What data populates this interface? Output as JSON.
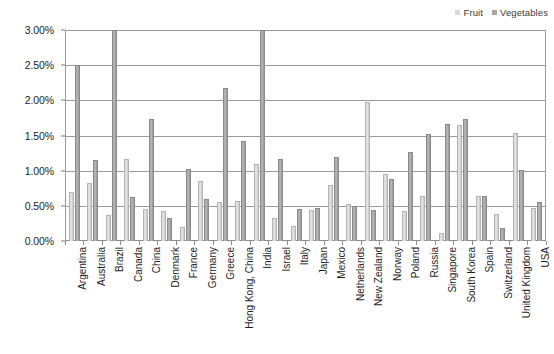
{
  "legend": {
    "position": "top-right",
    "entries": [
      {
        "label": "Fruit",
        "color": "#d9d9d9"
      },
      {
        "label": "Vegetables",
        "color": "#a6a6a6"
      }
    ]
  },
  "axis": {
    "y_ticks": [
      "0.00%",
      "0.50%",
      "1.00%",
      "1.50%",
      "2.00%",
      "2.50%",
      "3.00%"
    ]
  },
  "chart_data": {
    "type": "bar",
    "title": "",
    "subtitle": "",
    "xlabel": "",
    "ylabel": "",
    "grid": true,
    "legend_position": "top-right",
    "ylim": [
      0,
      3.0
    ],
    "y_tick_step": 0.5,
    "y_unit": "%",
    "y_tick_labels": [
      "0.00%",
      "0.50%",
      "1.00%",
      "1.50%",
      "2.00%",
      "2.50%",
      "3.00%"
    ],
    "categories": [
      "Argentina",
      "Australia",
      "Brazil",
      "Canada",
      "China",
      "Denmark",
      "France",
      "Germany",
      "Greece",
      "Hong Kong, China",
      "India",
      "Israel",
      "Italy",
      "Japan",
      "Mexico",
      "Netherlands",
      "New Zealand",
      "Norway",
      "Poland",
      "Russia",
      "Singapore",
      "South Korea",
      "Spain",
      "Switzerland",
      "United Kingdom",
      "USA"
    ],
    "series": [
      {
        "name": "Fruit",
        "color": "#d9d9d9",
        "values": [
          0.7,
          0.83,
          0.37,
          1.16,
          0.46,
          0.42,
          0.2,
          0.85,
          0.55,
          0.57,
          1.1,
          0.33,
          0.21,
          0.44,
          0.8,
          0.53,
          1.98,
          0.95,
          0.42,
          0.64,
          0.12,
          1.65,
          0.64,
          0.38,
          1.54,
          0.47
        ]
      },
      {
        "name": "Vegetables",
        "color": "#a6a6a6",
        "values": [
          2.5,
          1.15,
          3.1,
          0.63,
          1.73,
          0.33,
          1.02,
          0.6,
          2.18,
          1.42,
          3.1,
          1.17,
          0.45,
          0.47,
          1.2,
          0.5,
          0.44,
          0.88,
          1.26,
          1.52,
          1.67,
          1.73,
          0.64,
          0.18,
          1.01,
          0.55
        ]
      }
    ]
  }
}
